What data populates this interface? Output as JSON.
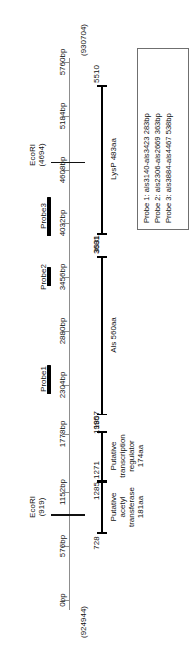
{
  "figure": {
    "type": "genetic-map",
    "orientation": "vertical-rotated",
    "axis": {
      "start_label": "0bp",
      "end_label": "5760bp",
      "start_coordinate": "(924944)",
      "end_coordinate": "(930704)",
      "unit": "bp",
      "range_bp": [
        0,
        5760
      ]
    },
    "scale_ticks": [
      {
        "label": "0bp",
        "bp": 0
      },
      {
        "label": "576bp",
        "bp": 576
      },
      {
        "label": "1152bp",
        "bp": 1152
      },
      {
        "label": "1778bp",
        "bp": 1778
      },
      {
        "label": "2304bp",
        "bp": 2304
      },
      {
        "label": "2880bp",
        "bp": 2880
      },
      {
        "label": "3456bp",
        "bp": 3456
      },
      {
        "label": "4032bp",
        "bp": 4032
      },
      {
        "label": "4608bp",
        "bp": 4608
      },
      {
        "label": "5184bp",
        "bp": 5184
      },
      {
        "label": "5760bp",
        "bp": 5760
      }
    ],
    "restriction_sites": [
      {
        "name": "EcoRI",
        "position": "(919)",
        "bp": 919
      },
      {
        "name": "EcoRI",
        "position": "(4694)",
        "bp": 4694
      }
    ],
    "probes": [
      {
        "label": "Probe1",
        "start_bp": 2210,
        "end_bp": 2520
      },
      {
        "label": "Probe2",
        "start_bp": 3360,
        "end_bp": 3560
      },
      {
        "label": "Probe3",
        "start_bp": 3900,
        "end_bp": 4320
      }
    ],
    "orfs": [
      {
        "name": "Putative acetyl transferase",
        "size": "181aa",
        "label_lines": [
          "Putative",
          "acetyl",
          "transferase",
          "181aa"
        ],
        "start_label": "728",
        "end_label": "1271",
        "start_bp": 728,
        "end_bp": 1271
      },
      {
        "name": "Putative transcription regulator",
        "size": "174aa",
        "label_lines": [
          "Putative",
          "transcription",
          "regulator",
          "174aa"
        ],
        "start_label": "1285",
        "end_label": "1807",
        "start_bp": 1285,
        "end_bp": 1807
      },
      {
        "name": "Als",
        "size": "560aa",
        "label_lines": [
          "Als 560aa"
        ],
        "start_label": "1995",
        "end_label": "3681",
        "start_bp": 1995,
        "end_bp": 3681
      },
      {
        "name": "LysP",
        "size": "483aa",
        "label_lines": [
          "LysP 483aa"
        ],
        "start_label": "3931",
        "end_label": "5510",
        "start_bp": 3931,
        "end_bp": 5510
      }
    ],
    "legend": {
      "entries": [
        "Probe 1: als3140-als3423 283bp",
        "Probe 2: als2306-als2669 363bp",
        "Probe 3: als3884-als4467 538bp"
      ]
    },
    "colors": {
      "axis": "#8d8d8d",
      "feature": "#000000",
      "legend_border": "#6f6f6f",
      "background": "#ffffff"
    }
  }
}
